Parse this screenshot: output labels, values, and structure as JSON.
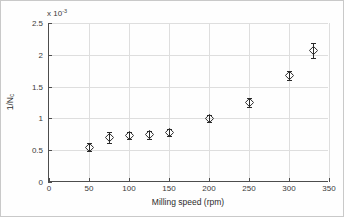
{
  "figure": {
    "background_color": "#fefefe",
    "border_color": "#c9c9c9",
    "axis_color": "#4d4d4d",
    "grid_color": "#dedede",
    "marker_color": "#2a2a2a"
  },
  "axes": {
    "y_multiplier_base": "x 10",
    "y_multiplier_exponent": "-3",
    "xlabel": "Milling speed (rpm)",
    "ylabel_main": "1/N",
    "ylabel_sub": "c",
    "x_ticks": [
      "0",
      "50",
      "100",
      "150",
      "200",
      "250",
      "300",
      "350"
    ],
    "y_ticks": [
      "0",
      "0.5",
      "1",
      "1.5",
      "2",
      "2.5"
    ]
  },
  "chart_data": {
    "type": "scatter",
    "title": "",
    "xlabel": "Milling speed (rpm)",
    "ylabel": "1/N_c",
    "y_scale_multiplier": 0.001,
    "y_multiplier_label": "x 10^-3",
    "xlim": [
      0,
      350
    ],
    "ylim": [
      0,
      2.5
    ],
    "xticks": [
      0,
      50,
      100,
      150,
      200,
      250,
      300,
      350
    ],
    "yticks": [
      0,
      0.5,
      1,
      1.5,
      2,
      2.5
    ],
    "grid": true,
    "legend": null,
    "marker": "diamond-open",
    "errorbars": true,
    "x": [
      50,
      75,
      100,
      125,
      150,
      200,
      250,
      300,
      330
    ],
    "y": [
      0.55,
      0.7,
      0.73,
      0.74,
      0.78,
      1.0,
      1.25,
      1.67,
      2.07
    ],
    "yerr": [
      0.06,
      0.09,
      0.06,
      0.06,
      0.06,
      0.05,
      0.07,
      0.07,
      0.12
    ],
    "points": [
      {
        "x": 50,
        "y": 0.55,
        "yerr": 0.06
      },
      {
        "x": 75,
        "y": 0.7,
        "yerr": 0.09
      },
      {
        "x": 100,
        "y": 0.73,
        "yerr": 0.06
      },
      {
        "x": 125,
        "y": 0.74,
        "yerr": 0.06
      },
      {
        "x": 150,
        "y": 0.78,
        "yerr": 0.06
      },
      {
        "x": 200,
        "y": 1.0,
        "yerr": 0.05
      },
      {
        "x": 250,
        "y": 1.25,
        "yerr": 0.07
      },
      {
        "x": 300,
        "y": 1.67,
        "yerr": 0.07
      },
      {
        "x": 330,
        "y": 2.07,
        "yerr": 0.12
      }
    ]
  }
}
